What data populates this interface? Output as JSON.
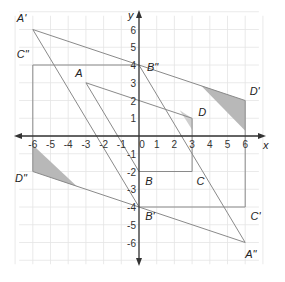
{
  "diagram": {
    "type": "coordinate-plane-transformations",
    "axes": {
      "x_label": "x",
      "y_label": "y",
      "x_ticks": [
        -6,
        -5,
        -4,
        -3,
        -2,
        -1,
        0,
        1,
        2,
        3,
        4,
        5,
        6
      ],
      "y_ticks": [
        -6,
        -5,
        -4,
        -3,
        -2,
        -1,
        1,
        2,
        3,
        4,
        5,
        6
      ],
      "x_tick_labels": [
        "-6",
        "-5",
        "-4",
        "-3",
        "-2",
        "-1",
        "0",
        "1",
        "2",
        "3",
        "4",
        "5",
        "6"
      ],
      "y_tick_labels": [
        "-6",
        "-5",
        "-4",
        "-3",
        "-2",
        "-1",
        "1",
        "2",
        "3",
        "4",
        "5",
        "6"
      ],
      "grid_range": {
        "x": [
          -7,
          7
        ],
        "y": [
          -7,
          7
        ]
      }
    },
    "colors": {
      "grid": "#e4e4e4",
      "axis": "#333333",
      "lines": "#8a8a8a",
      "shade_original": "#cfcfcf",
      "shade_images": "#b8b8b8"
    },
    "figures": [
      {
        "name": "original",
        "points": {
          "A": [
            -3,
            3
          ],
          "B": [
            0,
            -2
          ],
          "C": [
            3,
            -2
          ],
          "D": [
            3,
            1
          ]
        },
        "polyline": [
          [
            -3,
            3
          ],
          [
            3,
            1
          ],
          [
            3,
            -2
          ],
          [
            0,
            -2
          ],
          [
            -3,
            3
          ]
        ],
        "shaded": [
          [
            2.3,
            1.45
          ],
          [
            3,
            1
          ],
          [
            3,
            0.35
          ]
        ]
      },
      {
        "name": "prime",
        "points": {
          "A'": [
            -6,
            6
          ],
          "B'": [
            0,
            -4
          ],
          "C'": [
            6,
            -4
          ],
          "D'": [
            6,
            2
          ]
        },
        "polyline": [
          [
            -6,
            6
          ],
          [
            6,
            2
          ],
          [
            6,
            -4
          ],
          [
            0,
            -4
          ],
          [
            -6,
            6
          ]
        ],
        "shaded": [
          [
            3.5,
            2.85
          ],
          [
            6,
            2
          ],
          [
            6,
            0.3
          ]
        ]
      },
      {
        "name": "double-prime",
        "points": {
          "A\"": [
            6,
            -6
          ],
          "B\"": [
            0,
            4
          ],
          "C\"": [
            -6,
            4
          ],
          "D\"": [
            -6,
            -2
          ]
        },
        "polyline": [
          [
            6,
            -6
          ],
          [
            -6,
            -2
          ],
          [
            -6,
            4
          ],
          [
            0,
            4
          ],
          [
            6,
            -6
          ]
        ],
        "shaded": [
          [
            -6,
            -0.5
          ],
          [
            -6,
            -2
          ],
          [
            -3.5,
            -2.85
          ]
        ]
      }
    ],
    "labels": [
      {
        "text": "A",
        "at": [
          -3.6,
          3.3
        ]
      },
      {
        "text": "B",
        "at": [
          0.35,
          -2.75
        ]
      },
      {
        "text": "C",
        "at": [
          3.25,
          -2.75
        ]
      },
      {
        "text": "D",
        "at": [
          3.35,
          1.1
        ]
      },
      {
        "text": "A'",
        "at": [
          -6.9,
          6.4
        ]
      },
      {
        "text": "B'",
        "at": [
          0.35,
          -4.75
        ]
      },
      {
        "text": "C'",
        "at": [
          6.3,
          -4.75
        ]
      },
      {
        "text": "D'",
        "at": [
          6.25,
          2.3
        ]
      },
      {
        "text": "A\"",
        "at": [
          6.0,
          -6.9
        ]
      },
      {
        "text": "B\"",
        "at": [
          0.45,
          3.65
        ]
      },
      {
        "text": "C\"",
        "at": [
          -6.9,
          4.4
        ]
      },
      {
        "text": "D\"",
        "at": [
          -7.0,
          -2.6
        ]
      }
    ]
  }
}
